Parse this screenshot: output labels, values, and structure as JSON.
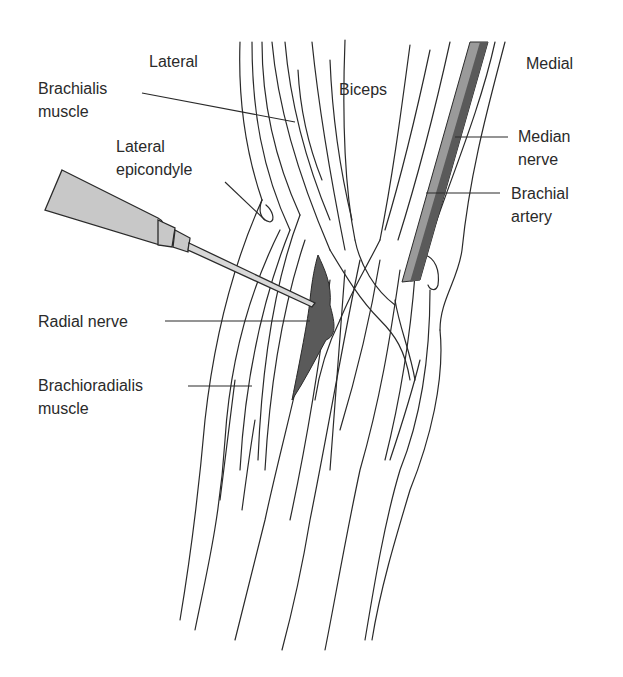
{
  "figure": {
    "type": "anatomical-illustration",
    "orientation": {
      "left": "Lateral",
      "right": "Medial"
    }
  },
  "labels": {
    "lateral": "Lateral",
    "medial": "Medial",
    "biceps": "Biceps",
    "brachialis_1": "Brachialis",
    "brachialis_2": "muscle",
    "lat_epi_1": "Lateral",
    "lat_epi_2": "epicondyle",
    "median_1": "Median",
    "median_2": "nerve",
    "brachial_1": "Brachial",
    "brachial_2": "artery",
    "radial": "Radial nerve",
    "brachiorad_1": "Brachioradialis",
    "brachiorad_2": "muscle"
  },
  "colors": {
    "line": "#2a2a2a",
    "nerve_dark": "#5a5a5a",
    "artery_light": "#9a9a9a",
    "syringe": "#c8c8c8"
  }
}
